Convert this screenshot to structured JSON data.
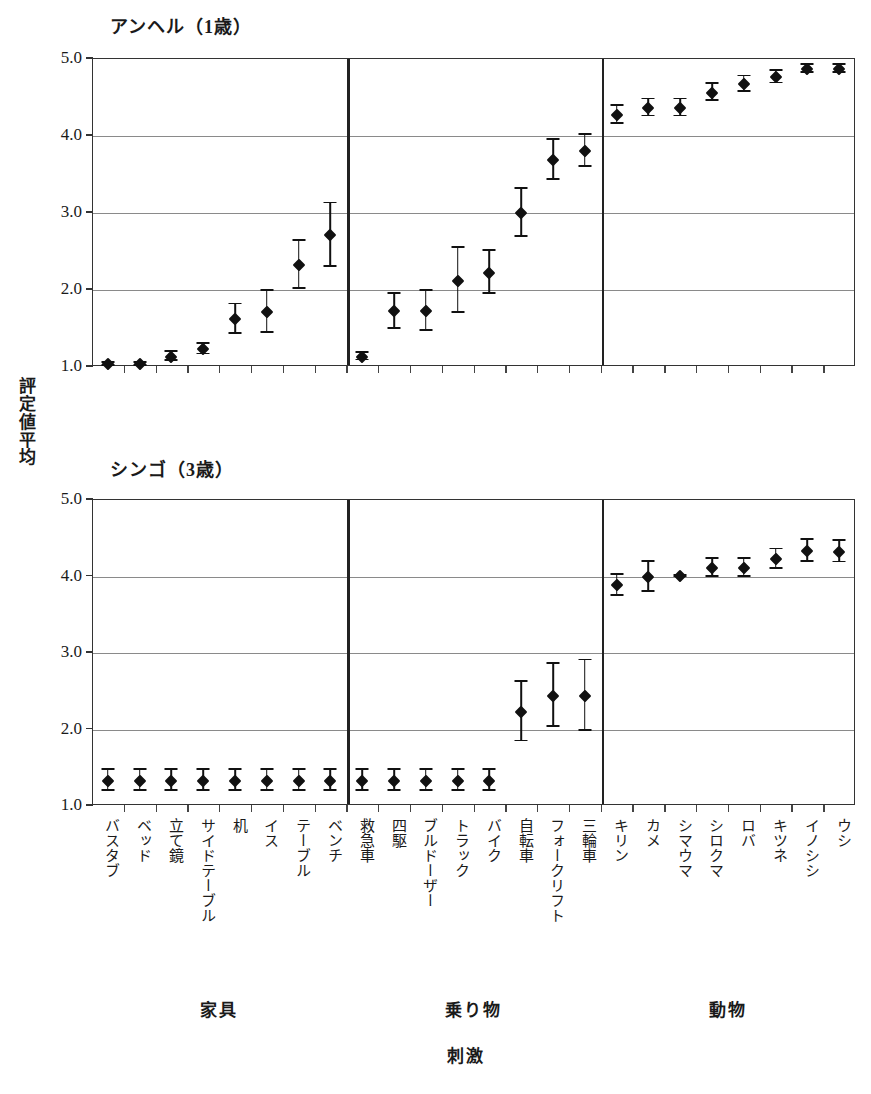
{
  "figure": {
    "y_axis_caption": "評定値平均",
    "y_axis_caption_chars": [
      "評",
      "定",
      "値",
      "平",
      "均"
    ],
    "x_axis_caption": "刺激",
    "y_ticks": [
      "5.0",
      "4.0",
      "3.0",
      "2.0",
      "1.0"
    ],
    "y_min": 1.0,
    "y_max": 5.0,
    "groups": [
      {
        "name": "家具",
        "count": 8
      },
      {
        "name": "乗り物",
        "count": 8
      },
      {
        "name": "動物",
        "count": 8
      }
    ],
    "categories": [
      "バスタブ",
      "ベッド",
      "立て鏡",
      "サイドテーブル",
      "机",
      "イス",
      "テーブル",
      "ベンチ",
      "救急車",
      "四駆",
      "ブルドーザー",
      "トラック",
      "バイク",
      "自転車",
      "フォークリフト",
      "三輪車",
      "キリン",
      "カメ",
      "シマウマ",
      "シロクマ",
      "ロバ",
      "キツネ",
      "イノシシ",
      "ウシ"
    ],
    "colors": {
      "marker": "#111111",
      "grid": "#8a8a8a",
      "frame": "#333333",
      "divider": "#222222",
      "background": "#ffffff"
    }
  },
  "chart_data": [
    {
      "type": "scatter",
      "title": "アンヘル（1歳）",
      "subject": "アンヘル",
      "age": "1歳",
      "xlabel": "刺激",
      "ylabel": "評定値平均",
      "ylim": [
        1.0,
        5.0
      ],
      "yticks": [
        1.0,
        2.0,
        3.0,
        4.0,
        5.0
      ],
      "grid": true,
      "legend": "none",
      "error_bars": "visible",
      "categories": [
        "バスタブ",
        "ベッド",
        "立て鏡",
        "サイドテーブル",
        "机",
        "イス",
        "テーブル",
        "ベンチ",
        "救急車",
        "四駆",
        "ブルドーザー",
        "トラック",
        "バイク",
        "自転車",
        "フォークリフト",
        "三輪車",
        "キリン",
        "カメ",
        "シマウマ",
        "シロクマ",
        "ロバ",
        "キツネ",
        "イノシシ",
        "ウシ"
      ],
      "values": [
        1.02,
        1.02,
        1.12,
        1.22,
        1.61,
        1.7,
        2.31,
        2.7,
        1.12,
        1.71,
        1.71,
        2.11,
        2.21,
        2.99,
        3.68,
        3.79,
        4.26,
        4.35,
        4.35,
        4.55,
        4.66,
        4.75,
        4.86,
        4.86
      ],
      "errors": [
        0.02,
        0.02,
        0.06,
        0.07,
        0.19,
        0.27,
        0.31,
        0.41,
        0.05,
        0.23,
        0.26,
        0.42,
        0.28,
        0.31,
        0.26,
        0.21,
        0.12,
        0.11,
        0.11,
        0.11,
        0.1,
        0.08,
        0.05,
        0.05
      ]
    },
    {
      "type": "scatter",
      "title": "シンゴ（3歳）",
      "subject": "シンゴ",
      "age": "3歳",
      "xlabel": "刺激",
      "ylabel": "評定値平均",
      "ylim": [
        1.0,
        5.0
      ],
      "yticks": [
        1.0,
        2.0,
        3.0,
        4.0,
        5.0
      ],
      "grid": true,
      "legend": "none",
      "error_bars": "visible",
      "categories": [
        "バスタブ",
        "ベッド",
        "立て鏡",
        "サイドテーブル",
        "机",
        "イス",
        "テーブル",
        "ベンチ",
        "救急車",
        "四駆",
        "ブルドーザー",
        "トラック",
        "バイク",
        "自転車",
        "フォークリフト",
        "三輪車",
        "キリン",
        "カメ",
        "シマウマ",
        "シロクマ",
        "ロバ",
        "キツネ",
        "イノシシ",
        "ウシ"
      ],
      "values": [
        1.32,
        1.32,
        1.32,
        1.32,
        1.32,
        1.32,
        1.32,
        1.32,
        1.32,
        1.32,
        1.32,
        1.32,
        1.32,
        2.22,
        2.43,
        2.43,
        3.87,
        3.98,
        3.99,
        4.1,
        4.1,
        4.21,
        4.32,
        4.31
      ],
      "errors": [
        0.14,
        0.14,
        0.14,
        0.14,
        0.14,
        0.14,
        0.14,
        0.14,
        0.14,
        0.14,
        0.14,
        0.14,
        0.14,
        0.39,
        0.41,
        0.46,
        0.14,
        0.2,
        0.01,
        0.12,
        0.12,
        0.13,
        0.14,
        0.14
      ]
    }
  ]
}
